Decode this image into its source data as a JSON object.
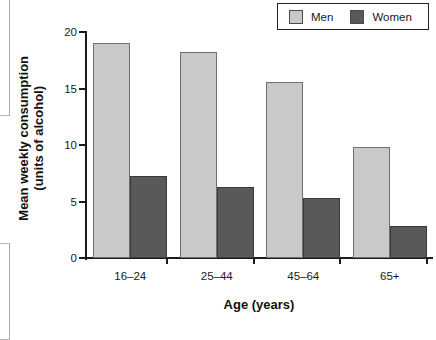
{
  "chart_data": {
    "type": "bar",
    "title": "",
    "subtitle": "",
    "categories": [
      "16–24",
      "25–44",
      "45–64",
      "65+"
    ],
    "series": [
      {
        "name": "Men",
        "color": "#c9c9c9",
        "values": [
          19.0,
          18.2,
          15.6,
          9.8
        ]
      },
      {
        "name": "Women",
        "color": "#595959",
        "values": [
          7.3,
          6.3,
          5.3,
          2.8
        ]
      }
    ],
    "xlabel": "Age (years)",
    "ylabel": "Mean weekly consumption (units of alcohol)",
    "ylabel_line1": "Mean weekly consumption",
    "ylabel_line2": "(units of alcohol)",
    "ylim": [
      0,
      20
    ],
    "ytick_values": [
      20,
      15,
      10,
      5,
      0
    ],
    "ytick_labels": [
      "20",
      "15",
      "10",
      "5",
      "0"
    ],
    "grid": false,
    "legend_position": "top-right",
    "legend_entries": [
      "Men",
      "Women"
    ]
  },
  "legend": {
    "entries": [
      {
        "label": "Men",
        "swatch_color": "#c9c9c9"
      },
      {
        "label": "Women",
        "swatch_color": "#595959"
      }
    ]
  },
  "axes": {
    "x_title": "Age (years)",
    "y_title_line1": "Mean weekly consumption",
    "y_title_line2": "(units of alcohol)",
    "y_ticks": [
      "20",
      "15",
      "10",
      "5",
      "0"
    ],
    "x_categories": [
      "16–24",
      "25–44",
      "45–64",
      "65+"
    ]
  }
}
